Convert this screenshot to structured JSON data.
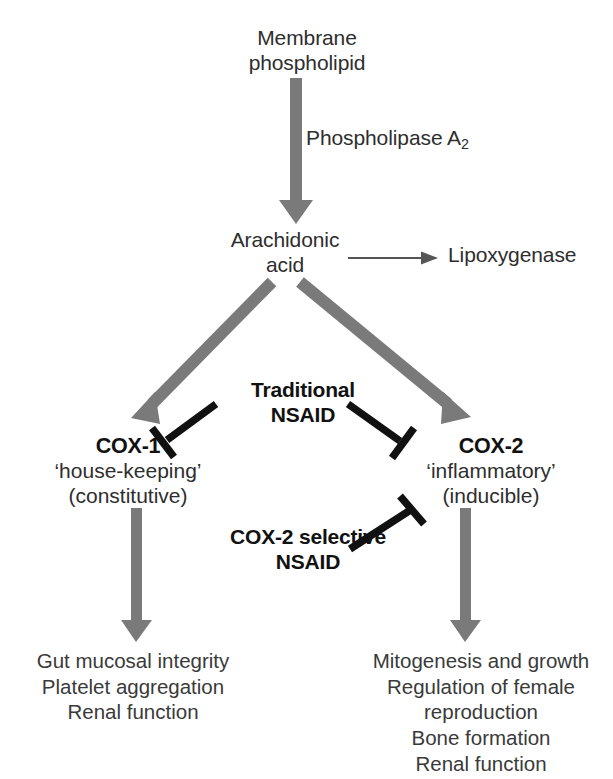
{
  "figure": {
    "background_color": "#ffffff",
    "flow_arrow_color": "#777777",
    "inhibitor_color": "#111111",
    "thin_arrow_color": "#555555"
  },
  "nodes": {
    "membrane_phospholipid": {
      "line1": "Membrane",
      "line2": "phospholipid"
    },
    "phospholipase": {
      "base": "Phospholipase A",
      "subscript": "2"
    },
    "arachidonic_acid": {
      "line1": "Arachidonic",
      "line2": "acid"
    },
    "lipoxygenase": {
      "label": "Lipoxygenase"
    },
    "traditional_nsaid": {
      "line1": "Traditional",
      "line2": "NSAID"
    },
    "cox1": {
      "header": "COX-1",
      "line2": "‘house-keeping’",
      "line3": "(constitutive)"
    },
    "cox2": {
      "header": "COX-2",
      "line2": "‘inflammatory’",
      "line3": "(inducible)"
    },
    "cox2_selective_nsaid": {
      "line1": "COX-2 selective",
      "line2": "NSAID"
    },
    "cox1_effects": {
      "line1": "Gut mucosal integrity",
      "line2": "Platelet aggregation",
      "line3": "Renal function"
    },
    "cox2_effects": {
      "line1": "Mitogenesis and growth",
      "line2": "Regulation of female",
      "line3": "reproduction",
      "line4": "Bone formation",
      "line5": "Renal function"
    }
  },
  "connectors": {
    "membrane_to_arachidonic": "thick-gray-down-arrow",
    "arachidonic_to_lipoxygenase": "thin-gray-right-arrow",
    "arachidonic_to_cox1": "thick-gray-diagonal-arrow-left",
    "arachidonic_to_cox2": "thick-gray-diagonal-arrow-right",
    "traditional_nsaid_to_cox1": "black-inhibition-tbar",
    "traditional_nsaid_to_cox2": "black-inhibition-tbar",
    "cox2_selective_to_cox2": "black-inhibition-tbar",
    "cox1_to_effects": "thick-gray-down-arrow",
    "cox2_to_effects": "thick-gray-down-arrow"
  }
}
